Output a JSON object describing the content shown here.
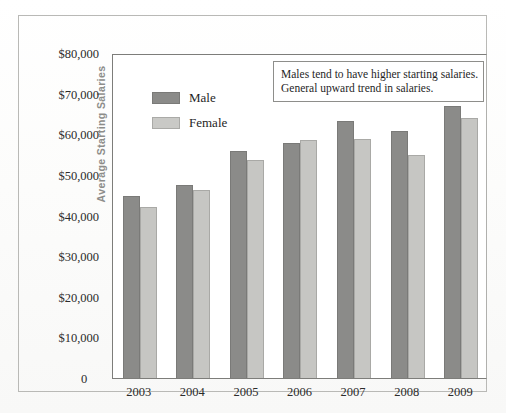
{
  "chart_data": {
    "type": "bar",
    "title": "",
    "xlabel": "",
    "ylabel": "Average Starting Salaries",
    "categories": [
      "2003",
      "2004",
      "2005",
      "2006",
      "2007",
      "2008",
      "2009"
    ],
    "series": [
      {
        "name": "Male",
        "color": "#8b8b89",
        "values": [
          44800,
          47400,
          55800,
          57800,
          63200,
          60800,
          67000
        ]
      },
      {
        "name": "Female",
        "color": "#c6c6c3",
        "values": [
          42000,
          46400,
          53600,
          58500,
          58900,
          55000,
          64000
        ]
      }
    ],
    "ylim": [
      0,
      80000
    ],
    "ytick_values": [
      0,
      10000,
      20000,
      30000,
      40000,
      50000,
      60000,
      70000,
      80000
    ],
    "ytick_labels": [
      "0",
      "$10,000",
      "$20,000",
      "$30,000",
      "$40,000",
      "$50,000",
      "$60,000",
      "$70,000",
      "$80,000"
    ],
    "grid": false,
    "legend_position": "upper-left-inside",
    "annotations": [
      "Males tend to have higher starting salaries.",
      "General upward trend in salaries."
    ]
  },
  "axes": {
    "y_title": "Average Starting Salaries",
    "y_labels": {
      "t80": "$80,000",
      "t70": "$70,000",
      "t60": "$60,000",
      "t50": "$50,000",
      "t40": "$40,000",
      "t30": "$30,000",
      "t20": "$20,000",
      "t10": "$10,000",
      "t0": "0"
    },
    "x_labels": {
      "y2003": "2003",
      "y2004": "2004",
      "y2005": "2005",
      "y2006": "2006",
      "y2007": "2007",
      "y2008": "2008",
      "y2009": "2009"
    }
  },
  "legend": {
    "male_label": "Male",
    "female_label": "Female"
  },
  "annotation": {
    "line1": "Males tend to have higher starting salaries.",
    "line2": "General upward trend in salaries."
  },
  "colors": {
    "male_bar": "#8b8b89",
    "female_bar": "#c6c6c3",
    "axis": "#7d7d7a",
    "text": "#1f1f1f",
    "y_title": "#8d8d8a"
  }
}
